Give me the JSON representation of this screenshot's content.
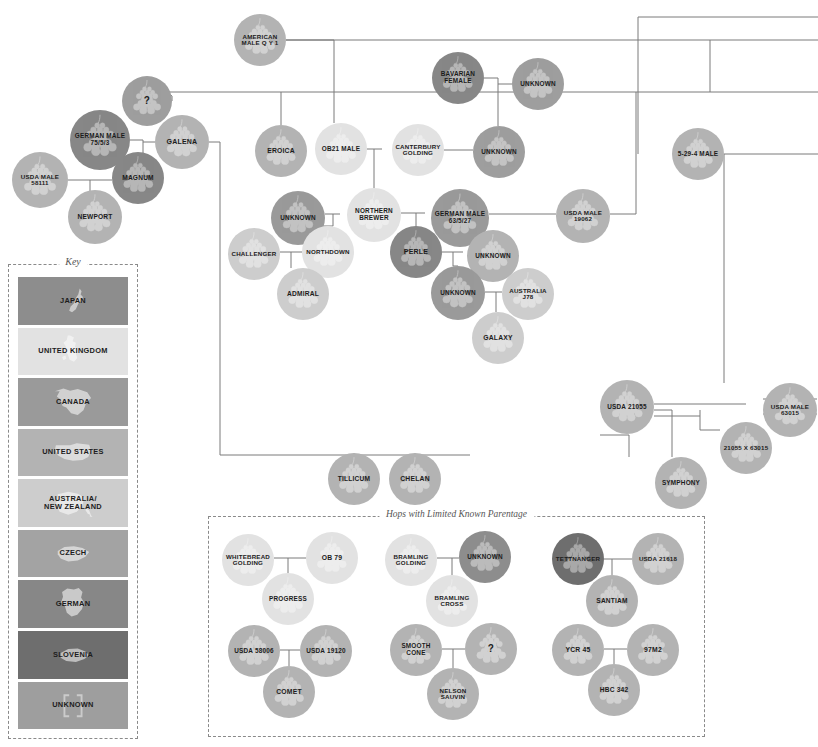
{
  "page": {
    "background": "#ffffff",
    "edge_color": "#7a7a7a"
  },
  "key": {
    "title": "Key",
    "items": [
      {
        "label": "JAPAN",
        "color": "#8d8d8d",
        "text": "dark",
        "class": "c-japan",
        "map": "japan"
      },
      {
        "label": "UNITED KINGDOM",
        "color": "#e2e2e2",
        "text": "dark",
        "class": "c-uk",
        "map": "uk"
      },
      {
        "label": "CANADA",
        "color": "#9a9a9a",
        "text": "dark",
        "class": "c-canada",
        "map": "canada"
      },
      {
        "label": "UNITED STATES",
        "color": "#b3b3b3",
        "text": "dark",
        "class": "c-us",
        "map": "us"
      },
      {
        "label": "AUSTRALIA/\nNEW ZEALAND",
        "color": "#cdcdcd",
        "text": "dark",
        "class": "c-anz",
        "map": "anz"
      },
      {
        "label": "CZECH",
        "color": "#a3a3a3",
        "text": "dark",
        "class": "c-czech",
        "map": "czech"
      },
      {
        "label": "GERMAN",
        "color": "#878787",
        "text": "dark",
        "class": "c-german",
        "map": "german"
      },
      {
        "label": "SLOVENIA",
        "color": "#6e6e6e",
        "text": "dark",
        "class": "c-slovenia",
        "map": "slovenia"
      },
      {
        "label": "UNKNOWN",
        "color": "#9e9e9e",
        "text": "dark",
        "class": "c-unknown",
        "map": "unknown"
      }
    ]
  },
  "limited_section": {
    "title": "Hops with Limited Known Parentage"
  },
  "chart_data": {
    "type": "diagram",
    "legend_position": "left",
    "nodes": [
      {
        "id": "american-male-qy1",
        "label": "AMERICAN MALE Q Y 1",
        "country": "UNITED STATES",
        "class": "c-us",
        "text": "dark",
        "x": 234,
        "y": 14,
        "d": 52,
        "fs": 6.2
      },
      {
        "id": "q-mark-top",
        "label": "?",
        "country": "UNKNOWN",
        "class": "c-unknown",
        "text": "dark",
        "x": 122,
        "y": 76,
        "d": 50,
        "fs": 10
      },
      {
        "id": "bavarian-female",
        "label": "BAVARIAN FEMALE",
        "country": "GERMAN",
        "class": "c-german",
        "text": "dark",
        "x": 432,
        "y": 52,
        "d": 52,
        "fs": 6.4
      },
      {
        "id": "unknown-bavaria",
        "label": "UNKNOWN",
        "country": "UNKNOWN",
        "class": "c-unknown",
        "text": "dark",
        "x": 512,
        "y": 58,
        "d": 52,
        "fs": 6.4
      },
      {
        "id": "german-male-7553",
        "label": "GERMAN MALE 75/5/3",
        "country": "GERMAN",
        "class": "c-german",
        "text": "dark",
        "x": 70,
        "y": 110,
        "d": 60,
        "fs": 6.4
      },
      {
        "id": "galena",
        "label": "GALENA",
        "country": "UNITED STATES",
        "class": "c-us",
        "text": "dark",
        "x": 155,
        "y": 115,
        "d": 54,
        "fs": 7
      },
      {
        "id": "eroica",
        "label": "EROICA",
        "country": "UNITED STATES",
        "class": "c-us",
        "text": "dark",
        "x": 255,
        "y": 125,
        "d": 52,
        "fs": 6.8
      },
      {
        "id": "ob21-male",
        "label": "OB21 MALE",
        "country": "UNITED KINGDOM",
        "class": "c-uk",
        "text": "dark",
        "x": 315,
        "y": 123,
        "d": 52,
        "fs": 6.4
      },
      {
        "id": "canterbury-golding",
        "label": "CANTERBURY GOLDING",
        "country": "UNITED KINGDOM",
        "class": "c-uk",
        "text": "dark",
        "x": 392,
        "y": 124,
        "d": 52,
        "fs": 6.2
      },
      {
        "id": "unknown-cant",
        "label": "UNKNOWN",
        "country": "UNKNOWN",
        "class": "c-unknown",
        "text": "dark",
        "x": 473,
        "y": 126,
        "d": 52,
        "fs": 6.4
      },
      {
        "id": "5-29-4-male",
        "label": "5-29-4 MALE",
        "country": "UNITED STATES",
        "class": "c-us",
        "text": "dark",
        "x": 672,
        "y": 128,
        "d": 52,
        "fs": 6.4
      },
      {
        "id": "usda-male-58111",
        "label": "USDA MALE 58111",
        "country": "UNITED STATES",
        "class": "c-us",
        "text": "dark",
        "x": 12,
        "y": 152,
        "d": 56,
        "fs": 6.2
      },
      {
        "id": "magnum",
        "label": "MAGNUM",
        "country": "GERMAN",
        "class": "c-german",
        "text": "dark",
        "x": 112,
        "y": 152,
        "d": 52,
        "fs": 6.6
      },
      {
        "id": "newport",
        "label": "NEWPORT",
        "country": "UNITED STATES",
        "class": "c-us",
        "text": "dark",
        "x": 68,
        "y": 190,
        "d": 54,
        "fs": 6.6
      },
      {
        "id": "unknown-nb",
        "label": "UNKNOWN",
        "country": "CANADA",
        "class": "c-canada",
        "text": "dark",
        "x": 271,
        "y": 191,
        "d": 54,
        "fs": 6.4
      },
      {
        "id": "northern-brewer",
        "label": "NORTHERN BREWER",
        "country": "UNITED KINGDOM",
        "class": "c-uk",
        "text": "dark",
        "x": 347,
        "y": 188,
        "d": 54,
        "fs": 6.4
      },
      {
        "id": "german-male-63527",
        "label": "GERMAN MALE 63/5/27",
        "country": "CANADA",
        "class": "c-canada",
        "text": "dark",
        "x": 431,
        "y": 189,
        "d": 58,
        "fs": 6.4
      },
      {
        "id": "usda-male-19062",
        "label": "USDA MALE 19062",
        "country": "UNITED STATES",
        "class": "c-us",
        "text": "dark",
        "x": 556,
        "y": 189,
        "d": 54,
        "fs": 6.2
      },
      {
        "id": "challenger",
        "label": "CHALLENGER",
        "country": "ANZ",
        "class": "c-anz",
        "text": "dark",
        "x": 228,
        "y": 228,
        "d": 52,
        "fs": 6.2
      },
      {
        "id": "northdown",
        "label": "NORTHDOWN",
        "country": "UNITED KINGDOM",
        "class": "c-uk",
        "text": "dark",
        "x": 302,
        "y": 226,
        "d": 52,
        "fs": 6.2
      },
      {
        "id": "perle",
        "label": "PERLE",
        "country": "GERMAN",
        "class": "c-german",
        "text": "dark",
        "x": 390,
        "y": 226,
        "d": 52,
        "fs": 7
      },
      {
        "id": "unknown-perle",
        "label": "UNKNOWN",
        "country": "UNITED STATES",
        "class": "c-us",
        "text": "dark",
        "x": 467,
        "y": 230,
        "d": 52,
        "fs": 6.4
      },
      {
        "id": "admiral",
        "label": "ADMIRAL",
        "country": "ANZ",
        "class": "c-anz",
        "text": "dark",
        "x": 277,
        "y": 268,
        "d": 52,
        "fs": 6.6
      },
      {
        "id": "unknown-galaxy",
        "label": "UNKNOWN",
        "country": "CANADA",
        "class": "c-canada",
        "text": "dark",
        "x": 431,
        "y": 266,
        "d": 54,
        "fs": 6.4
      },
      {
        "id": "australia-j78",
        "label": "AUSTRALIA J78",
        "country": "ANZ",
        "class": "c-anz",
        "text": "dark",
        "x": 502,
        "y": 268,
        "d": 52,
        "fs": 6.2
      },
      {
        "id": "galaxy",
        "label": "GALAXY",
        "country": "ANZ",
        "class": "c-anz",
        "text": "dark",
        "x": 472,
        "y": 312,
        "d": 52,
        "fs": 6.8
      },
      {
        "id": "usda-21055",
        "label": "USDA 21055",
        "country": "UNITED STATES",
        "class": "c-us",
        "text": "dark",
        "x": 600,
        "y": 380,
        "d": 54,
        "fs": 6.4
      },
      {
        "id": "usda-male-63015",
        "label": "USDA MALE 63015",
        "country": "UNITED STATES",
        "class": "c-us",
        "text": "dark",
        "x": 763,
        "y": 383,
        "d": 54,
        "fs": 6.2
      },
      {
        "id": "21055-x-63015",
        "label": "21055 X 63015",
        "country": "UNITED STATES",
        "class": "c-us",
        "text": "dark",
        "x": 720,
        "y": 422,
        "d": 52,
        "fs": 6.2
      },
      {
        "id": "symphony",
        "label": "SYMPHONY",
        "country": "UNITED STATES",
        "class": "c-us",
        "text": "dark",
        "x": 655,
        "y": 457,
        "d": 52,
        "fs": 6.4
      },
      {
        "id": "tillicum",
        "label": "TILLICUM",
        "country": "UNITED STATES",
        "class": "c-us",
        "text": "dark",
        "x": 328,
        "y": 453,
        "d": 52,
        "fs": 6.6
      },
      {
        "id": "chelan",
        "label": "CHELAN",
        "country": "UNITED STATES",
        "class": "c-us",
        "text": "dark",
        "x": 389,
        "y": 453,
        "d": 52,
        "fs": 6.8
      },
      {
        "id": "whitebread-golding",
        "label": "WHITEBREAD GOLDING",
        "country": "UNITED KINGDOM",
        "class": "c-uk",
        "text": "dark",
        "x": 222,
        "y": 534,
        "d": 52,
        "fs": 6.2
      },
      {
        "id": "ob-79",
        "label": "OB 79",
        "country": "UNITED KINGDOM",
        "class": "c-uk",
        "text": "dark",
        "x": 306,
        "y": 532,
        "d": 52,
        "fs": 6.8
      },
      {
        "id": "progress",
        "label": "PROGRESS",
        "country": "UNITED KINGDOM",
        "class": "c-uk",
        "text": "dark",
        "x": 262,
        "y": 573,
        "d": 52,
        "fs": 6.4
      },
      {
        "id": "bramling-golding",
        "label": "BRAMLING GOLDING",
        "country": "UNITED KINGDOM",
        "class": "c-uk",
        "text": "dark",
        "x": 385,
        "y": 534,
        "d": 52,
        "fs": 6.2
      },
      {
        "id": "unknown-bramling",
        "label": "UNKNOWN",
        "country": "JAPAN",
        "class": "c-japan",
        "text": "dark",
        "x": 459,
        "y": 531,
        "d": 52,
        "fs": 6.4
      },
      {
        "id": "bramling-cross",
        "label": "BRAMLING CROSS",
        "country": "UNITED KINGDOM",
        "class": "c-uk",
        "text": "dark",
        "x": 426,
        "y": 575,
        "d": 52,
        "fs": 6.2
      },
      {
        "id": "tettnanger",
        "label": "TETTNANGER",
        "country": "GERMAN",
        "class": "c-slovenia",
        "text": "dark",
        "x": 552,
        "y": 533,
        "d": 52,
        "fs": 6.2
      },
      {
        "id": "usda-21618",
        "label": "USDA 21618",
        "country": "UNITED STATES",
        "class": "c-us",
        "text": "dark",
        "x": 632,
        "y": 533,
        "d": 52,
        "fs": 6.2
      },
      {
        "id": "santiam",
        "label": "SANTIAM",
        "country": "UNITED STATES",
        "class": "c-us",
        "text": "dark",
        "x": 586,
        "y": 575,
        "d": 52,
        "fs": 6.6
      },
      {
        "id": "usda-58006",
        "label": "USDA 58006",
        "country": "UNITED STATES",
        "class": "c-us",
        "text": "dark",
        "x": 228,
        "y": 625,
        "d": 52,
        "fs": 6.4
      },
      {
        "id": "usda-19120",
        "label": "USDA 19120",
        "country": "UNITED STATES",
        "class": "c-us",
        "text": "dark",
        "x": 300,
        "y": 625,
        "d": 52,
        "fs": 6.4
      },
      {
        "id": "comet",
        "label": "COMET",
        "country": "UNITED STATES",
        "class": "c-us",
        "text": "dark",
        "x": 263,
        "y": 666,
        "d": 52,
        "fs": 6.8
      },
      {
        "id": "smooth-cone",
        "label": "SMOOTH CONE",
        "country": "UNITED STATES",
        "class": "c-us",
        "text": "dark",
        "x": 390,
        "y": 624,
        "d": 52,
        "fs": 6.4
      },
      {
        "id": "q-mark-ltd",
        "label": "?",
        "country": "UNITED STATES",
        "class": "c-us",
        "text": "dark",
        "x": 465,
        "y": 623,
        "d": 52,
        "fs": 10
      },
      {
        "id": "nelson-sauvin",
        "label": "NELSON SAUVIN",
        "country": "UNITED STATES",
        "class": "c-us",
        "text": "dark",
        "x": 427,
        "y": 668,
        "d": 52,
        "fs": 6.2
      },
      {
        "id": "ycr-45",
        "label": "YCR 45",
        "country": "UNITED STATES",
        "class": "c-us",
        "text": "dark",
        "x": 552,
        "y": 624,
        "d": 52,
        "fs": 6.8
      },
      {
        "id": "97m2",
        "label": "97M2",
        "country": "UNITED STATES",
        "class": "c-us",
        "text": "dark",
        "x": 627,
        "y": 624,
        "d": 52,
        "fs": 6.8
      },
      {
        "id": "hbc-342",
        "label": "HBC 342",
        "country": "UNITED STATES",
        "class": "c-us",
        "text": "dark",
        "x": 588,
        "y": 664,
        "d": 52,
        "fs": 6.6
      }
    ],
    "edge_count": 48
  }
}
